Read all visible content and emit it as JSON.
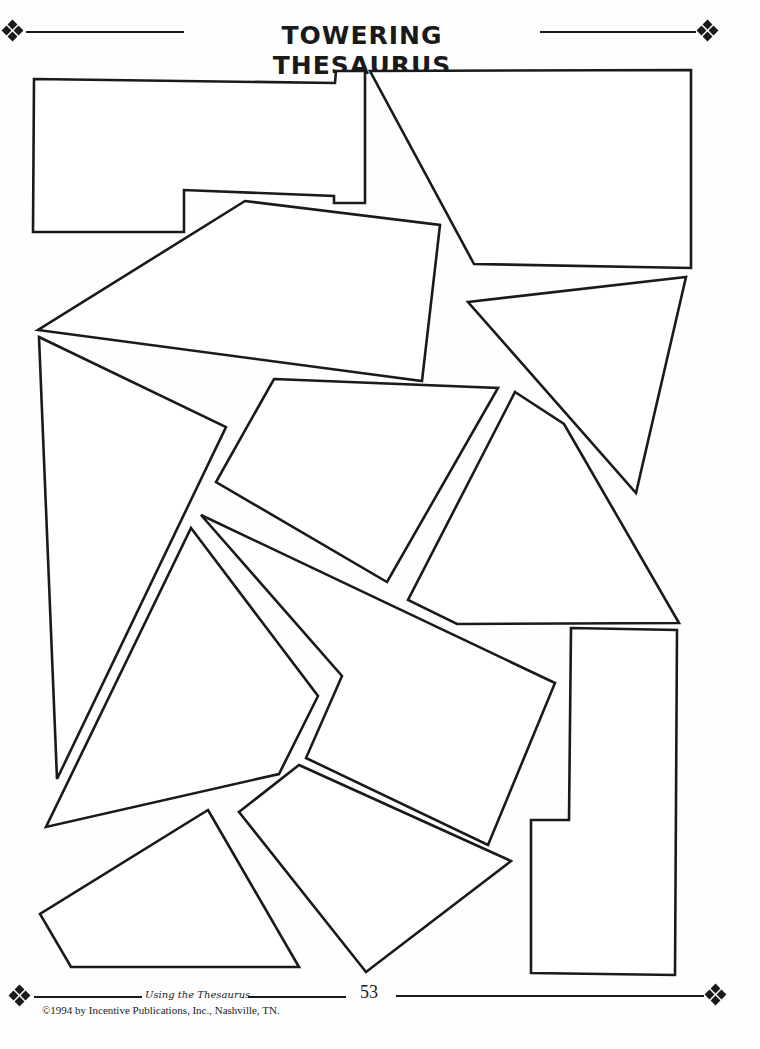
{
  "header": {
    "title": "TOWERING THESAURUS",
    "left_ornament": "diamond-cluster-icon",
    "right_ornament": "diamond-cluster-icon"
  },
  "puzzle": {
    "description": "Tangram-style puzzle pieces forming a tower when reassembled",
    "piece_count": 12,
    "pieces": [
      {
        "id": "piece-1",
        "shape": "notched-rectangle"
      },
      {
        "id": "piece-2",
        "shape": "trapezoid"
      },
      {
        "id": "piece-3",
        "shape": "quadrilateral"
      },
      {
        "id": "piece-4",
        "shape": "triangle"
      },
      {
        "id": "piece-5",
        "shape": "parallelogram"
      },
      {
        "id": "piece-6",
        "shape": "triangle"
      },
      {
        "id": "piece-7",
        "shape": "pentagon"
      },
      {
        "id": "piece-8",
        "shape": "quadrilateral"
      },
      {
        "id": "piece-9",
        "shape": "pentagon"
      },
      {
        "id": "piece-10",
        "shape": "l-shape"
      },
      {
        "id": "piece-11",
        "shape": "quadrilateral"
      },
      {
        "id": "piece-12",
        "shape": "quadrilateral"
      }
    ]
  },
  "footer": {
    "book_title": "Using the Thesaurus",
    "page_number": "53",
    "copyright": "©1994 by Incentive Publications, Inc., Nashville, TN.",
    "left_ornament": "diamond-cluster-icon",
    "right_ornament": "diamond-cluster-icon"
  }
}
